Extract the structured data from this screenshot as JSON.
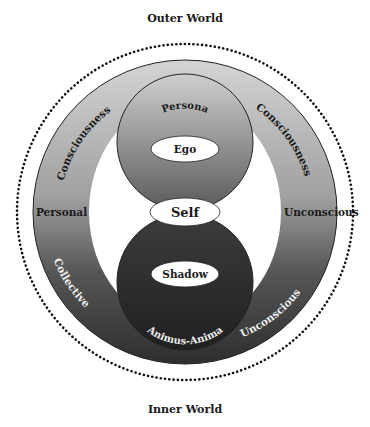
{
  "diagram": {
    "title_top": "Outer World",
    "title_bottom": "Inner World",
    "outer_ring": {
      "top_left": "Consciousness",
      "top_right": "Consciousness",
      "left": "Personal",
      "right": "Unconscious",
      "bottom_left": "Collective",
      "bottom_right": "Unconscious"
    },
    "upper_sphere": {
      "arc_label": "Persona",
      "core_label": "Ego"
    },
    "center_label": "Self",
    "lower_sphere": {
      "core_label": "Shadow",
      "arc_label": "Animus-Anima"
    },
    "colors": {
      "ring_light": "#c8c8c8",
      "ring_dark": "#3a3a3a",
      "text_dark": "#1a1a1a",
      "text_light": "#f0f0f0"
    }
  }
}
